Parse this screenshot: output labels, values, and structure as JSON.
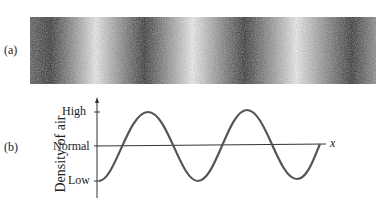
{
  "panel_a": {
    "label": "(a)",
    "description": "compression-rarefaction pattern of air density"
  },
  "panel_b": {
    "label": "(b)",
    "ylabel": "Density of air",
    "xlabel": "x",
    "ticks": [
      "High",
      "Normal",
      "Low"
    ]
  },
  "colors": {
    "ink": "#3a3a3a",
    "paper": "#ffffff"
  }
}
